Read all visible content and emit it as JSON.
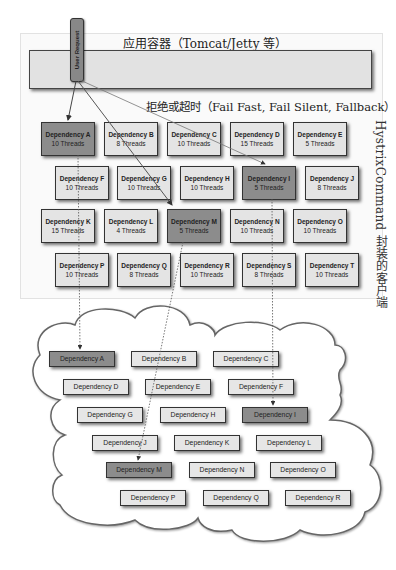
{
  "header": {
    "app_container_title": "应用容器（Tomcat/Jetty 等）",
    "user_request_label": "User Request",
    "reject_timeout_label": "拒绝或超时（Fail Fast, Fail Silent, Fallback）",
    "side_label": "HystrixCommand 封装的客户端"
  },
  "colors": {
    "box_fill": "#e4e4e4",
    "box_fill_failing": "#8c8c8c",
    "border": "#333333",
    "panel_bg": "#fafafa"
  },
  "command_pool": [
    {
      "name": "Dependency A",
      "threads": "10 Threads",
      "failing": true
    },
    {
      "name": "Dependency B",
      "threads": "8 Threads",
      "failing": false
    },
    {
      "name": "Dependency C",
      "threads": "10 Threads",
      "failing": false
    },
    {
      "name": "Dependency D",
      "threads": "15 Threads",
      "failing": false
    },
    {
      "name": "Dependency E",
      "threads": "5 Threads",
      "failing": false
    },
    {
      "name": "Dependency F",
      "threads": "10 Threads",
      "failing": false
    },
    {
      "name": "Dependency G",
      "threads": "10 Threads",
      "failing": false
    },
    {
      "name": "Dependency H",
      "threads": "10 Threads",
      "failing": false
    },
    {
      "name": "Dependency I",
      "threads": "5 Threads",
      "failing": true
    },
    {
      "name": "Dependency J",
      "threads": "8 Threads",
      "failing": false
    },
    {
      "name": "Dependency K",
      "threads": "15 Threads",
      "failing": false
    },
    {
      "name": "Dependency L",
      "threads": "4 Threads",
      "failing": false
    },
    {
      "name": "Dependency M",
      "threads": "5 Threads",
      "failing": true
    },
    {
      "name": "Dependency N",
      "threads": "10 Threads",
      "failing": false
    },
    {
      "name": "Dependency O",
      "threads": "10 Threads",
      "failing": false
    },
    {
      "name": "Dependency P",
      "threads": "10 Threads",
      "failing": false
    },
    {
      "name": "Dependency Q",
      "threads": "8 Threads",
      "failing": false
    },
    {
      "name": "Dependency R",
      "threads": "10 Threads",
      "failing": false
    },
    {
      "name": "Dependency S",
      "threads": "8 Threads",
      "failing": false
    },
    {
      "name": "Dependency T",
      "threads": "10 Threads",
      "failing": false
    }
  ],
  "cloud_dependencies": [
    {
      "name": "Dependency A",
      "failing": true
    },
    {
      "name": "Dependency B",
      "failing": false
    },
    {
      "name": "Dependency C",
      "failing": false
    },
    {
      "name": "Dependency D",
      "failing": false
    },
    {
      "name": "Dependency E",
      "failing": false
    },
    {
      "name": "Dependency F",
      "failing": false
    },
    {
      "name": "Dependency G",
      "failing": false
    },
    {
      "name": "Dependency H",
      "failing": false
    },
    {
      "name": "Dependency I",
      "failing": true
    },
    {
      "name": "Dependency J",
      "failing": false
    },
    {
      "name": "Dependency K",
      "failing": false
    },
    {
      "name": "Dependency L",
      "failing": false
    },
    {
      "name": "Dependency M",
      "failing": true
    },
    {
      "name": "Dependency N",
      "failing": false
    },
    {
      "name": "Dependency O",
      "failing": false
    },
    {
      "name": "Dependency P",
      "failing": false
    },
    {
      "name": "Dependency Q",
      "failing": false
    },
    {
      "name": "Dependency R",
      "failing": false
    }
  ]
}
